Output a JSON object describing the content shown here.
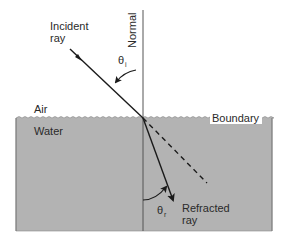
{
  "diagram": {
    "type": "refraction",
    "labels": {
      "incident_ray_line1": "Incident",
      "incident_ray_line2": "ray",
      "normal": "Normal",
      "theta_i": "θ",
      "theta_i_sub": "i",
      "air": "Air",
      "water": "Water",
      "boundary": "Boundary",
      "theta_r": "θ",
      "theta_r_sub": "r",
      "refracted_ray_line1": "Refracted",
      "refracted_ray_line2": "ray"
    },
    "colors": {
      "water_fill": "#b3b3b3",
      "line": "#1a1a1a",
      "background": "#ffffff",
      "boundary_label_bg": "#ffffff"
    }
  }
}
